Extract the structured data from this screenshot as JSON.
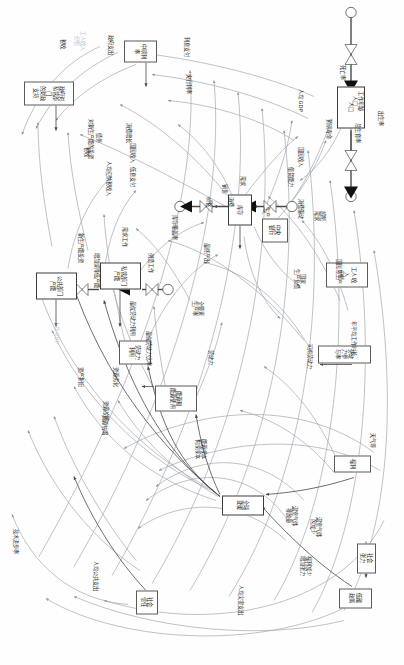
{
  "diagram": {
    "type": "causal-loop-stock-flow",
    "orientation_deg": 90,
    "background": "#fefefe",
    "line_color": "#8d96a0",
    "stroke_dark": "#4a4a4a",
    "faint_color": "#b9c4cf"
  },
  "nodes": [
    {
      "id": "n1",
      "label": "社会\n张力",
      "x": 543,
      "y": 28,
      "w": 30,
      "h": 19,
      "kind": "box"
    },
    {
      "id": "n2",
      "label": "低碳政策",
      "x": 588,
      "y": 32,
      "w": 20,
      "h": 33,
      "kind": "box"
    },
    {
      "id": "n3",
      "label": "社会\n信任",
      "x": 590,
      "y": 246,
      "w": 24,
      "h": 22,
      "kind": "box"
    },
    {
      "id": "n4",
      "label": "福利",
      "x": 455,
      "y": 33,
      "w": 17,
      "h": 37,
      "kind": "box"
    },
    {
      "id": "n5",
      "label": "全球变暖",
      "x": 495,
      "y": 140,
      "w": 20,
      "h": 42,
      "kind": "stock"
    },
    {
      "id": "n6",
      "label": "能源和\n能源使用",
      "x": 385,
      "y": 207,
      "w": 26,
      "h": 42,
      "kind": "box"
    },
    {
      "id": "n7",
      "label": "劳动力参与率",
      "x": 345,
      "y": 33,
      "w": 18,
      "h": 53,
      "kind": "box"
    },
    {
      "id": "n8",
      "label": "劳动力\n利用",
      "x": 340,
      "y": 253,
      "w": 24,
      "h": 32,
      "kind": "box"
    },
    {
      "id": "n9",
      "label": "工人收入\n份额",
      "x": 262,
      "y": 36,
      "w": 25,
      "h": 42,
      "kind": "box"
    },
    {
      "id": "n10",
      "label": "公共部门\n产能",
      "x": 272,
      "y": 327,
      "w": 27,
      "h": 41,
      "kind": "stock"
    },
    {
      "id": "n11",
      "label": "私营部门\n产能",
      "x": 262,
      "y": 263,
      "w": 27,
      "h": 41,
      "kind": "stock"
    },
    {
      "id": "n12",
      "label": "中央\n银行",
      "x": 218,
      "y": 116,
      "w": 24,
      "h": 26,
      "kind": "box"
    },
    {
      "id": "n13",
      "label": "库存",
      "x": 194,
      "y": 152,
      "w": 31,
      "h": 24,
      "kind": "stock"
    },
    {
      "id": "n14",
      "label": "人口",
      "x": 86,
      "y": 39,
      "w": 42,
      "h": 28,
      "kind": "stock"
    },
    {
      "id": "n15",
      "label": "中期利率",
      "x": 40,
      "y": 247,
      "w": 22,
      "h": 33,
      "kind": "box"
    },
    {
      "id": "n16",
      "label": "政府对私营部门\n的财政支持",
      "x": 81,
      "y": 330,
      "w": 24,
      "h": 50,
      "kind": "box"
    }
  ],
  "aux_labels": [
    {
      "id": "a1",
      "text": "福利减少\n增加张力",
      "x": 555,
      "y": 92
    },
    {
      "id": "a2",
      "text": "温室气体\n的减少",
      "x": 516,
      "y": 82
    },
    {
      "id": "a3",
      "text": "温室气体\n排放量",
      "x": 505,
      "y": 106
    },
    {
      "id": "a4",
      "text": "能源成本\n构成成本",
      "x": 438,
      "y": 197
    },
    {
      "id": "a5",
      "text": "天气等",
      "x": 432,
      "y": 28
    },
    {
      "id": "a6",
      "text": "可用劳动力",
      "x": 343,
      "y": 91
    },
    {
      "id": "a7",
      "text": "劳动力",
      "x": 349,
      "y": 190
    },
    {
      "id": "a8",
      "text": "人均公共支出",
      "x": 560,
      "y": 305
    },
    {
      "id": "a9",
      "text": "技术进步率",
      "x": 528,
      "y": 385
    },
    {
      "id": "a10",
      "text": "资源故障",
      "x": 400,
      "y": 295
    },
    {
      "id": "a11",
      "text": "资产折旧",
      "x": 366,
      "y": 320
    },
    {
      "id": "a12",
      "text": "年平均工作时长",
      "x": 320,
      "y": 47
    },
    {
      "id": "a13",
      "text": "全要素\n生产率",
      "x": 300,
      "y": 200
    },
    {
      "id": "a14",
      "text": "最优劳动力利用",
      "x": 300,
      "y": 268
    },
    {
      "id": "a15",
      "text": "国家\n生产负债",
      "x": 268,
      "y": 98
    },
    {
      "id": "a16",
      "text": "人均 GDP",
      "x": 320,
      "y": 344,
      "faint": true
    },
    {
      "id": "a17",
      "text": "最终产出",
      "x": 242,
      "y": 194
    },
    {
      "id": "a18",
      "text": "增加或降低产能",
      "x": 252,
      "y": 304
    },
    {
      "id": "a19",
      "text": "工作年龄\n人口",
      "x": 90,
      "y": 40
    },
    {
      "id": "a20",
      "text": "总生育率",
      "x": 122,
      "y": 43
    },
    {
      "id": "a21",
      "text": "需求工作",
      "x": 226,
      "y": 276
    },
    {
      "id": "a22",
      "text": "超额\n需求",
      "x": 210,
      "y": 78
    },
    {
      "id": "a23",
      "text": "消费驱动",
      "x": 198,
      "y": 100
    },
    {
      "id": "a24",
      "text": "新生产能投资",
      "x": 232,
      "y": 320
    },
    {
      "id": "a25",
      "text": "库存覆盖率",
      "x": 214,
      "y": 226
    },
    {
      "id": "a26",
      "text": "价格",
      "x": 196,
      "y": 192
    },
    {
      "id": "a27",
      "text": "销售",
      "x": 183,
      "y": 176
    },
    {
      "id": "a28",
      "text": "需求",
      "x": 175,
      "y": 158
    },
    {
      "id": "a29",
      "text": "借贷能力",
      "x": 166,
      "y": 110
    },
    {
      "id": "a30",
      "text": "低息支付",
      "x": 166,
      "y": 268
    },
    {
      "id": "a31",
      "text": "人均应纳税收入",
      "x": 160,
      "y": 292
    },
    {
      "id": "a32",
      "text": "国民收入",
      "x": 146,
      "y": 100
    },
    {
      "id": "a33",
      "text": "国民收入",
      "x": 142,
      "y": 268
    },
    {
      "id": "a34",
      "text": "税收",
      "x": 146,
      "y": 314
    },
    {
      "id": "a35",
      "text": "债务",
      "x": 132,
      "y": 302
    },
    {
      "id": "a36",
      "text": "消费增长",
      "x": 122,
      "y": 272
    },
    {
      "id": "a37",
      "text": "对新生产能的投资",
      "x": 118,
      "y": 310
    },
    {
      "id": "a38",
      "text": "预期寿命",
      "x": 118,
      "y": 72
    },
    {
      "id": "a39",
      "text": "人均 GDP",
      "x": 88,
      "y": 100
    },
    {
      "id": "a40",
      "text": "死亡率",
      "x": 64,
      "y": 58
    },
    {
      "id": "a41",
      "text": "出生率",
      "x": 110,
      "y": 20
    },
    {
      "id": "a42",
      "text": "央行利率",
      "x": 73,
      "y": 212
    },
    {
      "id": "a43",
      "text": "利息支付",
      "x": 36,
      "y": 214
    },
    {
      "id": "a44",
      "text": "政府支出",
      "x": 34,
      "y": 290
    },
    {
      "id": "a45",
      "text": "税收",
      "x": 38,
      "y": 338
    },
    {
      "id": "a46",
      "text": "工人收入\n份额",
      "x": 30,
      "y": 318,
      "faint": true
    },
    {
      "id": "a47",
      "text": "国民总生产",
      "x": 258,
      "y": 62
    },
    {
      "id": "a48",
      "text": "生产",
      "x": 206,
      "y": 134
    },
    {
      "id": "a49",
      "text": "消费",
      "x": 196,
      "y": 170
    },
    {
      "id": "a50",
      "text": "人均灾害支出",
      "x": 584,
      "y": 160
    },
    {
      "id": "a51",
      "text": "资源劣化",
      "x": 366,
      "y": 285
    },
    {
      "id": "a52",
      "text": "最优劳动力比率",
      "x": 330,
      "y": 252
    },
    {
      "id": "a53",
      "text": "资源枯竭",
      "x": 414,
      "y": 296
    },
    {
      "id": "a54",
      "text": "创造工作",
      "x": 252,
      "y": 250
    }
  ],
  "legend": {
    "stock_note": "方框 = 存量/变量",
    "flow_note": "箭头 = 因果关系"
  }
}
